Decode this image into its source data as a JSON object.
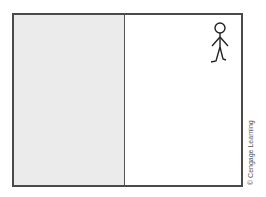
{
  "diagram": {
    "regions": [
      {
        "name": "left-half",
        "fill": "#ebebeb",
        "shaded": true
      },
      {
        "name": "right-half",
        "fill": "#ffffff",
        "shaded": false
      }
    ],
    "figure": {
      "type": "stick-figure",
      "location": "top-right"
    },
    "colors": {
      "border": "#4a4a4a",
      "shade": "#ebebeb",
      "ink": "#222222"
    }
  },
  "credit": "© Cengage Learning"
}
